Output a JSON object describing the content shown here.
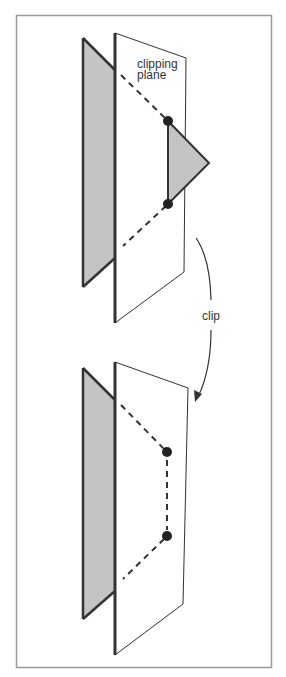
{
  "figure": {
    "frame_color": "#9a9a9a",
    "plane_fill": "#ffffff",
    "plane_stroke": "#333333",
    "polygon_fill": "#c4c4c4",
    "line_color": "#333333",
    "dot_color": "#222222"
  },
  "labels": {
    "plane_line1": "clipping",
    "plane_line2": "plane",
    "arrow": "clip"
  },
  "panels": [
    {
      "name": "before-clip",
      "description": "Triangle straddling the clipping plane; part beyond the plane is shaded",
      "intersection_points": 2
    },
    {
      "name": "after-clip",
      "description": "Clipped polygon lies on the kept side; new edge drawn dashed between intersection points",
      "intersection_points": 2
    }
  ]
}
